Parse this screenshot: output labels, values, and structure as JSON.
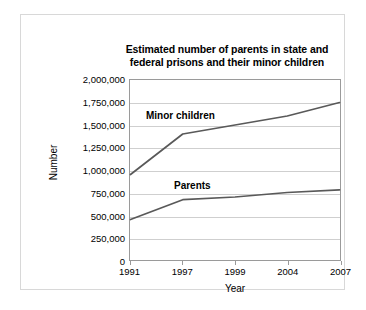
{
  "chart_data": {
    "type": "line",
    "title": "Estimated number of parents in state and federal prisons and their minor children",
    "title_line1": "Estimated number of parents in state and",
    "title_line2": "federal prisons and their minor children",
    "xlabel": "Year",
    "ylabel": "Number",
    "categories": [
      "1991",
      "1997",
      "1999",
      "2004",
      "2007"
    ],
    "ylim": [
      0,
      2000000
    ],
    "yticks": [
      2000000,
      1750000,
      1500000,
      1250000,
      1000000,
      750000,
      500000,
      250000,
      0
    ],
    "ytick_labels": [
      "2,000,000",
      "1,750,000",
      "1,500,000",
      "1,250,000",
      "1,000,000",
      "750,000",
      "500,000",
      "250,000",
      "0"
    ],
    "grid": true,
    "grid_axis": "y",
    "legend": "inline-labels",
    "series": [
      {
        "name": "Minor children",
        "label": "Minor children",
        "color": "#595959",
        "values": [
          950000,
          1400000,
          1500000,
          1600000,
          1750000
        ]
      },
      {
        "name": "Parents",
        "label": "Parents",
        "color": "#595959",
        "values": [
          450000,
          670000,
          700000,
          750000,
          780000
        ]
      }
    ]
  },
  "colors": {
    "line": "#595959",
    "grid": "#cfcfcf",
    "frame": "#9a9a9a",
    "card_border": "#d8d8d8",
    "text": "#000000",
    "background": "#ffffff"
  }
}
